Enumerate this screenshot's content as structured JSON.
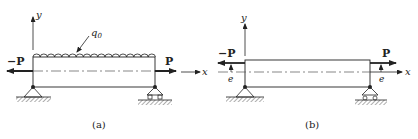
{
  "figures": [
    {
      "id": "a",
      "caption": "(a)",
      "axis_x_label": "x",
      "axis_y_label": "y",
      "load_label": "q0",
      "load_label_main": "q",
      "load_label_sub": "0",
      "left_force_label": "−P",
      "right_force_label": "P",
      "left_support": "pin",
      "right_support": "roller"
    },
    {
      "id": "b",
      "caption": "(b)",
      "axis_x_label": "x",
      "axis_y_label": "y",
      "left_force_label": "−P",
      "right_force_label": "P",
      "left_eccentricity_label": "e",
      "right_eccentricity_label": "e",
      "left_support": "pin",
      "right_support": "roller"
    }
  ],
  "colors": {
    "line": "#222222",
    "hatch": "#888888"
  }
}
